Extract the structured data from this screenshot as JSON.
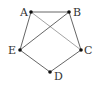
{
  "diagram": {
    "type": "graph",
    "vertices": [
      {
        "id": "A",
        "label": "A",
        "x": 31,
        "y": 12,
        "lx": 20,
        "ly": 16
      },
      {
        "id": "B",
        "label": "B",
        "x": 69,
        "y": 12,
        "lx": 73,
        "ly": 16
      },
      {
        "id": "C",
        "label": "C",
        "x": 81,
        "y": 50,
        "lx": 84,
        "ly": 54
      },
      {
        "id": "D",
        "label": "D",
        "x": 50,
        "y": 72,
        "lx": 54,
        "ly": 80
      },
      {
        "id": "E",
        "label": "E",
        "x": 20,
        "y": 50,
        "lx": 8,
        "ly": 54
      }
    ],
    "edges": [
      {
        "from": "A",
        "to": "B"
      },
      {
        "from": "B",
        "to": "C"
      },
      {
        "from": "C",
        "to": "D"
      },
      {
        "from": "D",
        "to": "E"
      },
      {
        "from": "E",
        "to": "A"
      },
      {
        "from": "A",
        "to": "C",
        "light": true
      },
      {
        "from": "B",
        "to": "E"
      }
    ]
  }
}
